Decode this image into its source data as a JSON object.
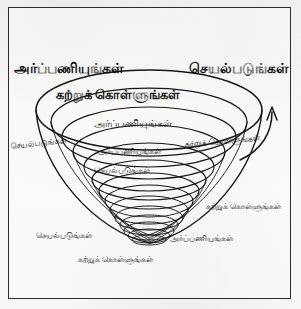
{
  "figure": {
    "title_visible": false,
    "frame": {
      "border_color": "#2b2b2b",
      "background": "#f7f6f4"
    },
    "ink_color": "#161616",
    "description_type": "funnel-spiral-diagram"
  },
  "labels": {
    "commit": "அர்ப்பணியுங்கள்",
    "act": "செயல்படுங்கள்",
    "learn": "கற்றுக் கொள்ளுங்கள்"
  },
  "ring_labels": [
    {
      "id": "commit-top-left",
      "text": "அர்ப்பணியுங்கள்",
      "x": 14,
      "y": 61,
      "size": 13.5,
      "bold": true,
      "rotate": 0
    },
    {
      "id": "act-top-right",
      "text": "செயல்படுங்கள்",
      "x": 189,
      "y": 61,
      "size": 13.5,
      "bold": true,
      "rotate": 0
    },
    {
      "id": "learn-ring-1",
      "text": "கற்றுக் கொள்ளுங்கள்",
      "x": 56,
      "y": 88,
      "size": 12.5,
      "bold": true,
      "rotate": 0
    },
    {
      "id": "commit-ring-2",
      "text": "அர்ப்பணியுங்கள்",
      "x": 94,
      "y": 118,
      "size": 9.5,
      "bold": false,
      "rotate": 0
    },
    {
      "id": "act-left-outer",
      "text": "செயல்படுங்கள்",
      "x": 11,
      "y": 139,
      "size": 7.8,
      "bold": false,
      "rotate": -6
    },
    {
      "id": "learn-right-outer",
      "text": "கற்றுக் கொள்ளுங்கள்",
      "x": 185,
      "y": 137,
      "size": 8.2,
      "bold": false,
      "rotate": -5
    },
    {
      "id": "commit-ring-3",
      "text": "அர்ப்பணியுங்கள்",
      "x": 98,
      "y": 147,
      "size": 8.0,
      "bold": false,
      "rotate": 0
    },
    {
      "id": "act-ring-4",
      "text": "செயல்படுங்கள்",
      "x": 94,
      "y": 166,
      "size": 8.0,
      "bold": false,
      "rotate": 0
    },
    {
      "id": "learn-right-lower",
      "text": "கற்றுக் கொள்ளுங்கள்",
      "x": 206,
      "y": 202,
      "size": 8.2,
      "bold": false,
      "rotate": 0
    },
    {
      "id": "act-bottom-left",
      "text": "செயல்படுங்கள்",
      "x": 36,
      "y": 231,
      "size": 8.2,
      "bold": false,
      "rotate": 0
    },
    {
      "id": "commit-bottom-right",
      "text": "அர்ப்பணியுங்கள்",
      "x": 170,
      "y": 234,
      "size": 8.2,
      "bold": false,
      "rotate": 0
    },
    {
      "id": "learn-bottom-center",
      "text": "கற்றுக் கொள்ளுங்கள்",
      "x": 78,
      "y": 255,
      "size": 8.2,
      "bold": false,
      "rotate": 0
    }
  ]
}
